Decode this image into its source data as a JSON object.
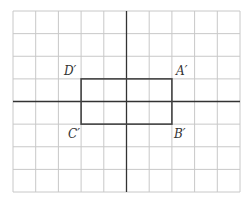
{
  "diagram": {
    "type": "coordinate-grid-transformation",
    "grid": {
      "columns": 10,
      "rows": 8,
      "left": 13,
      "top": 11,
      "right": 240,
      "bottom": 192,
      "grid_color": "#c8c8c8",
      "axis_color": "#333333"
    },
    "axes": {
      "x_axis_row": 4,
      "y_axis_col": 5
    },
    "rectangle": {
      "color": "#444444",
      "col_left": 3,
      "col_right": 7,
      "row_top": 3,
      "row_bottom": 5
    },
    "vertices": [
      {
        "name": "A'",
        "label": "A′",
        "position": "top-right"
      },
      {
        "name": "B'",
        "label": "B′",
        "position": "bottom-right"
      },
      {
        "name": "C'",
        "label": "C′",
        "position": "bottom-left"
      },
      {
        "name": "D'",
        "label": "D′",
        "position": "top-left"
      }
    ]
  }
}
